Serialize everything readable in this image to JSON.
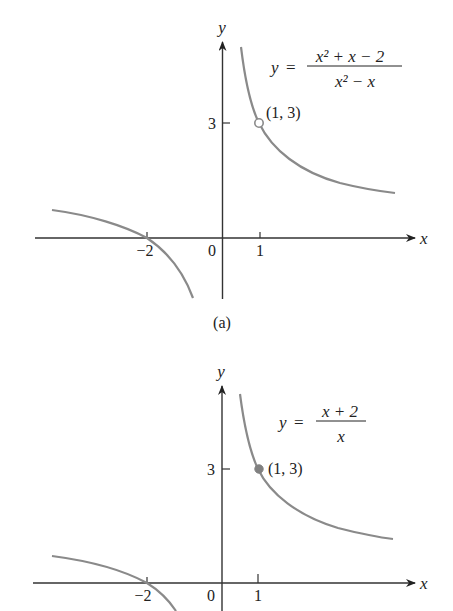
{
  "figure": {
    "panels": [
      {
        "id": "a",
        "caption": "(a)",
        "equation": {
          "lhs": "y",
          "eq": "=",
          "numerator": "x² + x − 2",
          "denominator": "x² − x"
        },
        "axis_labels": {
          "x": "x",
          "y": "y"
        },
        "ticks": {
          "x": [
            "−2",
            "0",
            "1"
          ],
          "y": [
            "3"
          ]
        },
        "point": {
          "label": "(1, 3)",
          "style": "open"
        }
      },
      {
        "id": "b",
        "caption": "",
        "equation": {
          "lhs": "y",
          "eq": "=",
          "numerator": "x + 2",
          "denominator": "x"
        },
        "axis_labels": {
          "x": "x",
          "y": "y"
        },
        "ticks": {
          "x": [
            "−2",
            "0",
            "1"
          ],
          "y": [
            "3"
          ]
        },
        "point": {
          "label": "(1, 3)",
          "style": "filled"
        }
      }
    ],
    "colors": {
      "curve": "#8a8a8a",
      "axis": "#333333",
      "point_fill": "#808080"
    }
  }
}
